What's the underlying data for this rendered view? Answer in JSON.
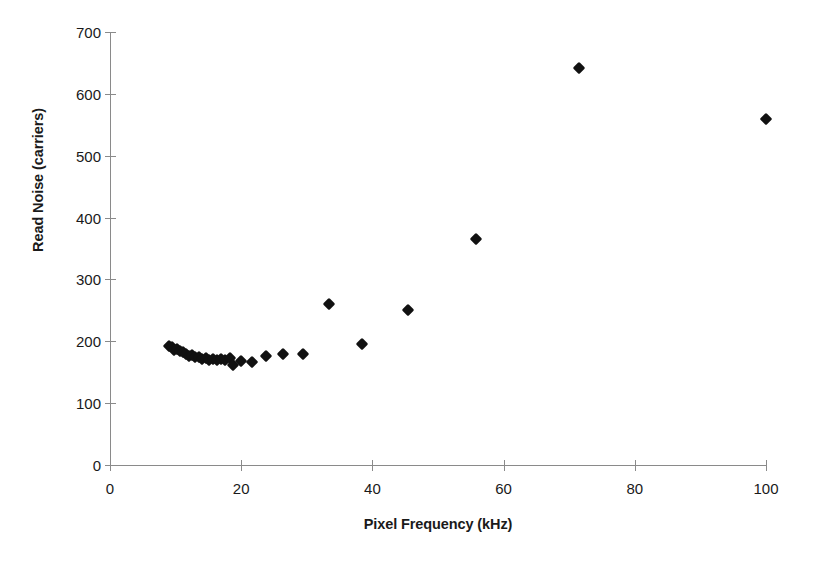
{
  "chart_data": {
    "type": "scatter",
    "title": "",
    "xlabel": "Pixel Frequency (kHz)",
    "ylabel": "Read Noise (carriers)",
    "xlim": [
      0,
      100
    ],
    "ylim": [
      0,
      700
    ],
    "xticks": [
      0,
      20,
      40,
      60,
      80,
      100
    ],
    "yticks": [
      0,
      100,
      200,
      300,
      400,
      500,
      600,
      700
    ],
    "grid": false,
    "legend": null,
    "marker": "diamond",
    "marker_color": "#111111",
    "series": [
      {
        "name": "Read noise vs pixel frequency",
        "points": [
          [
            9.0,
            193
          ],
          [
            9.4,
            190
          ],
          [
            9.8,
            186
          ],
          [
            10.2,
            188
          ],
          [
            10.7,
            184
          ],
          [
            11.1,
            182
          ],
          [
            11.6,
            180
          ],
          [
            12.0,
            176
          ],
          [
            12.5,
            178
          ],
          [
            13.0,
            175
          ],
          [
            13.5,
            174
          ],
          [
            14.0,
            172
          ],
          [
            14.6,
            173
          ],
          [
            15.1,
            170
          ],
          [
            15.7,
            171
          ],
          [
            16.3,
            169
          ],
          [
            16.9,
            172
          ],
          [
            17.6,
            170
          ],
          [
            18.3,
            173
          ],
          [
            18.8,
            161
          ],
          [
            20.0,
            168
          ],
          [
            21.6,
            167
          ],
          [
            23.8,
            176
          ],
          [
            26.3,
            180
          ],
          [
            29.4,
            179
          ],
          [
            33.4,
            260
          ],
          [
            38.4,
            196
          ],
          [
            45.4,
            250
          ],
          [
            55.8,
            366
          ],
          [
            71.5,
            641
          ],
          [
            100.0,
            560
          ]
        ]
      }
    ]
  },
  "axes": {
    "y_tick_labels": [
      "700",
      "600",
      "500",
      "400",
      "300",
      "200",
      "100",
      "0"
    ],
    "x_tick_labels": [
      "0",
      "20",
      "40",
      "60",
      "80",
      "100"
    ]
  }
}
